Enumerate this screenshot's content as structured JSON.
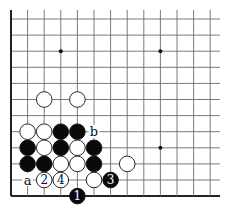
{
  "diagram": {
    "type": "go-board-corner",
    "grid": {
      "origin_x": 11,
      "origin_y": 19,
      "spacing_x": 16.6,
      "spacing_y": 16.1,
      "columns": 13,
      "rows": 12,
      "top_open": true,
      "right_open": true,
      "left_edge": true,
      "bottom_edge": true,
      "line_color": "#6b6b6b",
      "edge_color": "#222222"
    },
    "star_points": [
      {
        "col": 3,
        "row": 2
      },
      {
        "col": 9,
        "row": 2
      },
      {
        "col": 9,
        "row": 8
      }
    ],
    "stones": [
      {
        "color": "white",
        "col": 2,
        "row": 5,
        "label": ""
      },
      {
        "color": "white",
        "col": 4,
        "row": 5,
        "label": ""
      },
      {
        "color": "white",
        "col": 1,
        "row": 7,
        "label": ""
      },
      {
        "color": "white",
        "col": 2,
        "row": 7,
        "label": ""
      },
      {
        "color": "black",
        "col": 3,
        "row": 7,
        "label": ""
      },
      {
        "color": "black",
        "col": 4,
        "row": 7,
        "label": ""
      },
      {
        "color": "black",
        "col": 1,
        "row": 8,
        "label": ""
      },
      {
        "color": "white",
        "col": 2,
        "row": 8,
        "label": ""
      },
      {
        "color": "black",
        "col": 3,
        "row": 8,
        "label": ""
      },
      {
        "color": "white",
        "col": 4,
        "row": 8,
        "label": ""
      },
      {
        "color": "black",
        "col": 5,
        "row": 8,
        "label": ""
      },
      {
        "color": "black",
        "col": 1,
        "row": 9,
        "label": ""
      },
      {
        "color": "black",
        "col": 2,
        "row": 9,
        "label": ""
      },
      {
        "color": "white",
        "col": 3,
        "row": 9,
        "label": ""
      },
      {
        "color": "white",
        "col": 4,
        "row": 9,
        "label": ""
      },
      {
        "color": "black",
        "col": 5,
        "row": 9,
        "label": ""
      },
      {
        "color": "white",
        "col": 7,
        "row": 9,
        "label": ""
      },
      {
        "color": "white",
        "col": 2,
        "row": 10,
        "label": "2"
      },
      {
        "color": "white",
        "col": 3,
        "row": 10,
        "label": "4"
      },
      {
        "color": "white",
        "col": 5,
        "row": 10,
        "label": ""
      },
      {
        "color": "black",
        "col": 6,
        "row": 10,
        "label": "3"
      },
      {
        "color": "black",
        "col": 4,
        "row": 11,
        "label": "1"
      }
    ],
    "marks": [
      {
        "text": "a",
        "col": 1,
        "row": 10
      },
      {
        "text": "b",
        "col": 5,
        "row": 7
      }
    ]
  }
}
